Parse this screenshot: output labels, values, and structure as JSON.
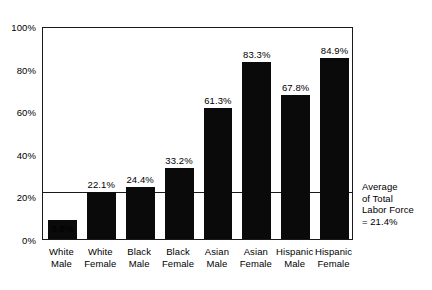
{
  "figure": {
    "scan_artifact_text": "",
    "annotation_lines": [
      "Average",
      "of Total",
      "Labor Force",
      "= 21.4%"
    ]
  },
  "chart_data": {
    "type": "bar",
    "title": "",
    "subtitle": "",
    "xlabel": "",
    "ylabel": "",
    "ylim": [
      0,
      100
    ],
    "yticks": [
      0,
      20,
      40,
      60,
      80,
      100
    ],
    "ytick_labels": [
      "0%",
      "20%",
      "40%",
      "60%",
      "80%",
      "100%"
    ],
    "grid": false,
    "legend": null,
    "categories": [
      "White Male",
      "White Female",
      "Black Male",
      "Black Female",
      "Asian Male",
      "Asian Female",
      "Hispanic Male",
      "Hispanic Female"
    ],
    "category_lines": [
      [
        "White",
        "Male"
      ],
      [
        "White",
        "Female"
      ],
      [
        "Black",
        "Male"
      ],
      [
        "Black",
        "Female"
      ],
      [
        "Asian",
        "Male"
      ],
      [
        "Asian",
        "Female"
      ],
      [
        "Hispanic",
        "Male"
      ],
      [
        "Hispanic",
        "Female"
      ]
    ],
    "values": [
      8.8,
      22.1,
      24.4,
      33.2,
      61.3,
      83.3,
      67.8,
      84.9
    ],
    "value_labels": [
      "8.8%",
      "22.1%",
      "24.4%",
      "33.2%",
      "61.3%",
      "83.3%",
      "67.8%",
      "84.9%"
    ],
    "value_label_position": [
      "below",
      "above",
      "above",
      "above",
      "above",
      "above",
      "above",
      "above"
    ],
    "bar_color": "#0a0a0a",
    "reference_line": {
      "label": "Average of Total Labor Force",
      "value": 21.4,
      "value_label": "= 21.4%"
    }
  }
}
